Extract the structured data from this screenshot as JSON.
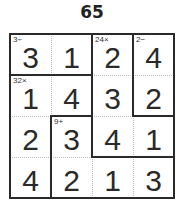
{
  "puzzle": {
    "number": "65",
    "size": 4,
    "cells": [
      [
        "3",
        "1",
        "2",
        "4"
      ],
      [
        "1",
        "4",
        "3",
        "2"
      ],
      [
        "2",
        "3",
        "4",
        "1"
      ],
      [
        "4",
        "2",
        "1",
        "3"
      ]
    ],
    "cages": [
      {
        "clue": "3÷",
        "cells": [
          [
            0,
            0
          ],
          [
            0,
            1
          ]
        ]
      },
      {
        "clue": "24×",
        "cells": [
          [
            0,
            2
          ],
          [
            1,
            2
          ],
          [
            2,
            2
          ],
          [
            2,
            3
          ]
        ]
      },
      {
        "clue": "2−",
        "cells": [
          [
            0,
            3
          ],
          [
            1,
            3
          ]
        ]
      },
      {
        "clue": "32×",
        "cells": [
          [
            1,
            0
          ],
          [
            1,
            1
          ],
          [
            2,
            0
          ],
          [
            3,
            0
          ]
        ]
      },
      {
        "clue": "9+",
        "cells": [
          [
            2,
            1
          ],
          [
            3,
            1
          ],
          [
            3,
            2
          ],
          [
            3,
            3
          ]
        ]
      }
    ],
    "colors": {
      "line": "#2a2a2a",
      "dotted": "#bdbdbd",
      "text": "#2a2a2a"
    }
  }
}
